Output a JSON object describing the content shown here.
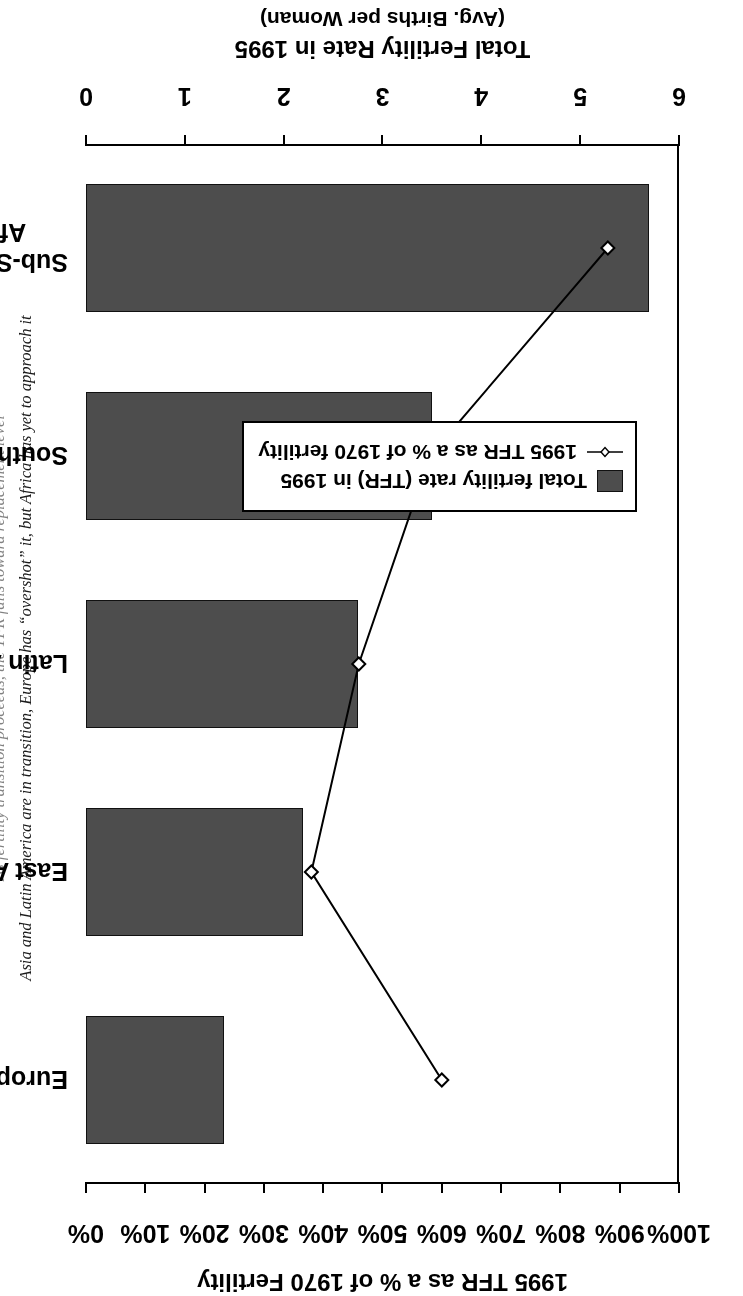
{
  "caption": {
    "clipped_line": "As fertility transition proceeds, the TFR falls toward replacement level",
    "line": "Asia and Latin America are in transition, Europe has “overshot” it, but Africa has yet to approach it"
  },
  "axes": {
    "percent": {
      "title": "1995 TFR as a % of 1970 Fertility",
      "ticks": [
        "100%",
        "90%",
        "80%",
        "70%",
        "60%",
        "50%",
        "40%",
        "30%",
        "20%",
        "10%",
        "0%"
      ],
      "min": 0,
      "max": 100
    },
    "tfr": {
      "title": "Total Fertility Rate in 1995",
      "subtitle": "(Avg. Births per Woman)",
      "ticks": [
        "6",
        "5",
        "4",
        "3",
        "2",
        "1",
        "0"
      ],
      "min": 0,
      "max": 6
    }
  },
  "legend": {
    "items": [
      {
        "label": "Total fertility rate (TFR) in 1995",
        "marker": "filled-square-swatch",
        "color": "#4d4d4d"
      },
      {
        "label": "1995 TFR as a % of 1970 fertility",
        "marker": "line-with-open-diamond",
        "color": "#000000"
      }
    ]
  },
  "chart_data": {
    "type": "bar",
    "title": "Total Fertility Rate in 1995",
    "subtitle": "Asia and Latin America are in transition, Europe has “overshot” it, but Africa has yet to approach it",
    "categories": [
      "European Union",
      "East Asia",
      "Latin America",
      "South Asia",
      "Sub-Saharan Africa"
    ],
    "xlabel": "",
    "ylabel": "Total Fertility Rate in 1995 (Avg. Births per Woman)",
    "ylim": [
      0,
      6
    ],
    "y2label": "1995 TFR as a % of 1970 Fertility",
    "y2lim": [
      0,
      100
    ],
    "grid": false,
    "legend_position": "inside-left",
    "series": [
      {
        "name": "Total fertility rate (TFR) in 1995",
        "type": "bar",
        "axis": "left",
        "unit": "births per woman",
        "values": [
          1.4,
          2.2,
          2.75,
          3.5,
          5.7
        ]
      },
      {
        "name": "1995 TFR as a % of 1970 fertility",
        "type": "line",
        "axis": "right",
        "unit": "%",
        "marker": "open-diamond",
        "values": [
          60,
          38,
          46,
          58,
          88
        ]
      }
    ]
  }
}
